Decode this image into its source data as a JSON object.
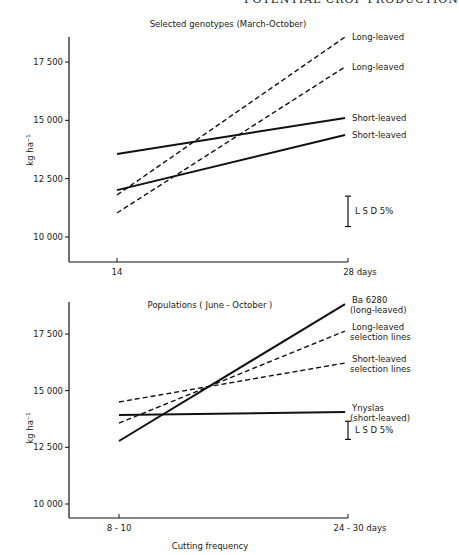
{
  "page_header": "POTENTIAL CROP PRODUCTION",
  "chart_data": [
    {
      "type": "line",
      "title": "Selected genotypes (March-October)",
      "xlabel": "",
      "ylabel": "kg ha⁻¹",
      "x": [
        "14",
        "28 days"
      ],
      "x_tick_labels": [
        "14",
        "28 days"
      ],
      "y_ticks": [
        10000,
        12500,
        15000,
        17500
      ],
      "y_tick_labels": [
        "10 000",
        "12 500",
        "15 000",
        "17 500"
      ],
      "ylim": [
        8800,
        18800
      ],
      "grid": false,
      "series": [
        {
          "name": "Long-leaved",
          "style": "dashed",
          "values": [
            11800,
            18570
          ]
        },
        {
          "name": "Long-leaved",
          "style": "dashed",
          "values": [
            11030,
            17290
          ]
        },
        {
          "name": "Short-leaved",
          "style": "solid",
          "values": [
            13560,
            15100
          ]
        },
        {
          "name": "Short-leaved",
          "style": "solid",
          "values": [
            12010,
            14370
          ]
        }
      ],
      "annotations": [
        {
          "text": "L S D 5%",
          "type": "error-bar",
          "range": [
            10450,
            11750
          ]
        }
      ]
    },
    {
      "type": "line",
      "title": "Populations ( June - October )",
      "xlabel": "Cutting frequency",
      "ylabel": "kg ha⁻¹",
      "x": [
        "8 - 10",
        "24 - 30 days"
      ],
      "x_tick_labels": [
        "8 - 10",
        "24 - 30 days"
      ],
      "y_ticks": [
        10000,
        12500,
        15000,
        17500
      ],
      "y_tick_labels": [
        "10 000",
        "12 500",
        "15 000",
        "17 500"
      ],
      "ylim": [
        9400,
        19000
      ],
      "grid": false,
      "series": [
        {
          "name": "Ba 6280 (long-leaved)",
          "label_lines": [
            "Ba 6280",
            "(long-leaved)"
          ],
          "style": "solid",
          "values": [
            12780,
            18820
          ]
        },
        {
          "name": "Long-leaved selection lines",
          "label_lines": [
            "Long-leaved",
            "selection lines"
          ],
          "style": "dashed",
          "values": [
            13570,
            17630
          ]
        },
        {
          "name": "Short-leaved selection lines",
          "label_lines": [
            "Short-leaved",
            "selection lines"
          ],
          "style": "dashed",
          "values": [
            14500,
            16220
          ]
        },
        {
          "name": "Ynyslas (short-leaved)",
          "label_lines": [
            "Ynyslas",
            "(short-leaved)"
          ],
          "style": "solid",
          "values": [
            13930,
            14060
          ]
        }
      ],
      "annotations": [
        {
          "text": "L S D 5%",
          "type": "error-bar",
          "range": [
            12850,
            13650
          ]
        }
      ]
    }
  ]
}
